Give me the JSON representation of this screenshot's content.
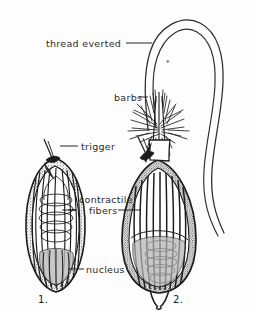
{
  "figure": {
    "background_color": "#fdfdfd",
    "ink_color": "#1c1c1c",
    "text_color": "#2b2b2b",
    "width": 257,
    "height": 313,
    "labels": {
      "thread_everted": "thread everted",
      "barbs": "barbs",
      "trigger": "trigger",
      "contractile": "contractile",
      "fibers": "fibers",
      "nucleus": "nucleus"
    },
    "figure_numbers": {
      "one": "1.",
      "two": "2."
    },
    "panels": [
      {
        "number": "1.",
        "state": "undischarged",
        "shape": "oval lemon-shaped capsule",
        "features": [
          "trigger",
          "contractile fibers",
          "nucleus",
          "coiled inner thread",
          "stippled wall"
        ]
      },
      {
        "number": "2.",
        "state": "discharged",
        "shape": "pear flask-shaped capsule",
        "features": [
          "trigger",
          "contractile fibers",
          "nucleus",
          "everted thread",
          "barbs",
          "flared base"
        ]
      }
    ],
    "marks": {
      "asterisk": "*"
    }
  }
}
